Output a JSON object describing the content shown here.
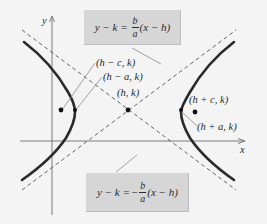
{
  "diagram": {
    "type": "hyperbola-horizontal-transverse-axis",
    "axes": {
      "x_label": "x",
      "y_label": "y"
    },
    "points": [
      {
        "id": "center",
        "label": "(h, k)"
      },
      {
        "id": "left-focus",
        "label": "(h − c, k)"
      },
      {
        "id": "left-vertex",
        "label": "(h − a, k)"
      },
      {
        "id": "right-focus",
        "label": "(h + c, k)"
      },
      {
        "id": "right-vertex",
        "label": "(h + a, k)"
      }
    ],
    "asymptotes": {
      "upper": {
        "lhs": "y − k =",
        "sign": "",
        "frac_num": "b",
        "frac_den": "a",
        "rhs": "(x − h)"
      },
      "lower": {
        "lhs": "y − k =",
        "sign": "−",
        "frac_num": "b",
        "frac_den": "a",
        "rhs": "(x − h)"
      }
    },
    "colors": {
      "background": "#f4f4f4",
      "curve": "#2b2b2b",
      "asymptote": "#555555",
      "axis": "#6e6e6e",
      "label_box": "#d6d6d6",
      "leader_line": "#8a8a8a"
    }
  }
}
